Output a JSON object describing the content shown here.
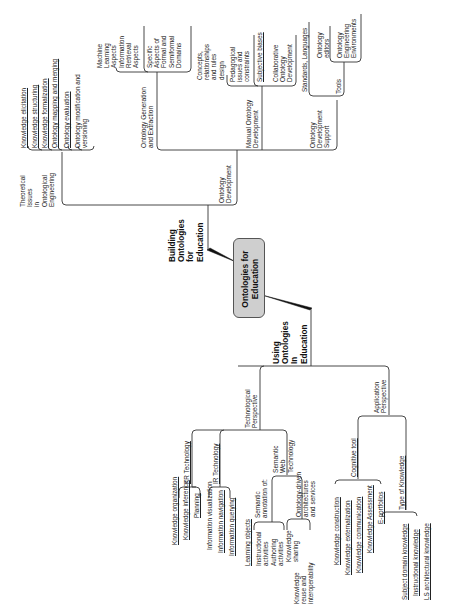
{
  "center": {
    "line1": "Ontologies for",
    "line2": "Education",
    "fill": "#cfcfcf"
  },
  "building": {
    "label": "Building\nOntologies\nfor\nEducation",
    "theoretical": {
      "label": "Theoretical\nIssues\nin\nOntological\nEngineering",
      "items": [
        "Knowledge elicitation",
        "Knowledge structuring",
        "Knowledge formalization",
        "Ontology mapping and merging",
        "Ontology evaluation",
        "Ontology modification and\nversioning"
      ]
    },
    "development": {
      "label": "Ontology\nDevelopment",
      "generation": {
        "label": "Ontology Generation\nand Extraction",
        "items": [
          "Machine\nLearning\nAspects",
          "Information\nRetrieval\nAspects",
          "Specific\nAspects of\nFormal and\nSemiformal\nDomains"
        ]
      },
      "manual": {
        "label": "Manual Ontology\nDevelopment",
        "items": [
          "Concepts,\nrelationships\nand rules\ndesign",
          "Pedagogical\nissues and\nconstraints",
          "Subjective biases",
          "Collaborative\nOntology\nDevelopment"
        ]
      },
      "support": {
        "label": "Ontology\nDevelopment\nSupport",
        "standards": "Standards, Languages",
        "tools": {
          "label": "Tools",
          "items": [
            "Ontology\neditors",
            "Ontology\nEngineering\nEnvironments"
          ]
        }
      }
    }
  },
  "using": {
    "label": "Using\nOntologies\nIn\nEducation",
    "technological": {
      "label": "Technological\nPerspective",
      "kr": {
        "label": "KR Technology",
        "items": [
          "Knowledge organization",
          "Knowledge inference",
          "Planning"
        ]
      },
      "ir": {
        "label": "IR Technology",
        "items": [
          "Information visualization",
          "Information navigation",
          "Information querying"
        ]
      },
      "semantic_web": {
        "label": "Semantic\nWeb\nTechnology",
        "annotation": {
          "label": "Semantic\nannotation of:",
          "items": [
            "Learning objects",
            "Instructional\nactivities",
            "Authoring\nactivities"
          ]
        },
        "services": {
          "label": "Ontology-driven\narchitectures\nand services",
          "items": [
            "Knowledge\nsharing",
            "Knowledge\nreuse and\ninteroperability"
          ]
        }
      }
    },
    "application": {
      "label": "Application\nPerspective",
      "cognitive": {
        "label": "Cognitive tool",
        "items": [
          "Knowledge construction",
          "Knowledge externalization",
          "Knowledge communication",
          "Knowledge Assessment",
          "E-portfolios"
        ]
      },
      "knowledge_type": {
        "label": "Type of Knowledge",
        "items": [
          "Subject domain knowledge",
          "Instructional knowledge",
          "LS architectural knowledge"
        ]
      }
    }
  }
}
